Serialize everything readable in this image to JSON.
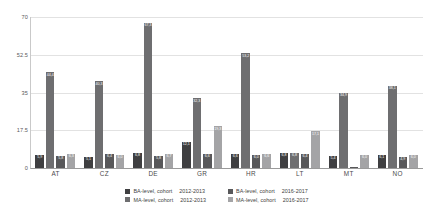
{
  "chart_data": {
    "type": "bar",
    "title": "",
    "xlabel": "",
    "ylabel": "",
    "ylim": [
      0,
      70
    ],
    "yticks": [
      "0",
      "17.5",
      "35",
      "52.5",
      "70"
    ],
    "ytick_values": [
      0,
      17.5,
      35,
      52.5,
      70
    ],
    "grid": true,
    "legend_position": "bottom",
    "categories": [
      "AT",
      "CZ",
      "DE",
      "GR",
      "HR",
      "LT",
      "MT",
      "NO"
    ],
    "series": [
      {
        "name": "BA-level, cohort 2012-2013",
        "color": "#3f3f41",
        "values": [
          5.9,
          5.1,
          6.8,
          12.1,
          6.6,
          6.8,
          5.4,
          6.1
        ],
        "labels": [
          "5,9",
          "5,1",
          "6,8",
          "12,1",
          "6,6",
          "6,8",
          "5,4",
          "6,1"
        ]
      },
      {
        "name": "MA-level, cohort 2012-2013",
        "color": "#6e6e70",
        "values": [
          44.4,
          40.3,
          67.3,
          32.3,
          53.2,
          6.8,
          34.9,
          38.1
        ],
        "labels": [
          "44,4",
          "40,3",
          "67,3",
          "32,3",
          "53,2",
          "6,8",
          "34,9",
          "38,1"
        ]
      },
      {
        "name": "BA-level, cohort 2016-2017",
        "color": "#58585a",
        "values": [
          5.8,
          6.4,
          5.8,
          6.6,
          6.0,
          6.4,
          0.4,
          4.9
        ],
        "labels": [
          "5,8",
          "6,4",
          "5,8",
          "6,6",
          "6,0",
          "6,4",
          "0,4",
          "4,9"
        ]
      },
      {
        "name": "MA-level, cohort 2016-2017",
        "color": "#a4a4a6",
        "values": [
          6.3,
          6.0,
          6.7,
          19.3,
          6.6,
          17.1,
          6.0,
          6.0
        ],
        "labels": [
          "6,3",
          "6,0",
          "6,7",
          "19,3",
          "6,6",
          "17,1",
          "6,0",
          "6,0"
        ]
      }
    ]
  },
  "legend": {
    "columns": [
      {
        "entries": [
          {
            "label": "BA-level, cohort",
            "year": "2012-2013",
            "color": "#3f3f41"
          },
          {
            "label": "MA-level, cohort",
            "year": "2012-2013",
            "color": "#6e6e70"
          }
        ]
      },
      {
        "entries": [
          {
            "label": "BA-level, cohort",
            "year": "2016-2017",
            "color": "#58585a"
          },
          {
            "label": "MA-level, cohort",
            "year": "2016-2017",
            "color": "#a4a4a6"
          }
        ]
      }
    ]
  }
}
